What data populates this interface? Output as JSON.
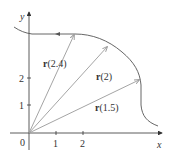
{
  "diagram": {
    "type": "vector-function-plot",
    "axes": {
      "x_label": "x",
      "y_label": "y",
      "origin_label": "0",
      "x_ticks": [
        "1",
        "2"
      ],
      "y_ticks": [
        "1",
        "2"
      ]
    },
    "vectors": [
      {
        "label_bold": "r",
        "label_arg": "(2.4)"
      },
      {
        "label_bold": "r",
        "label_arg": "(2)"
      },
      {
        "label_bold": "r",
        "label_arg": "(1.5)"
      }
    ],
    "colors": {
      "axis": "#333333",
      "curve": "#555555",
      "vector": "#9a9a9a",
      "text": "#333333"
    }
  }
}
